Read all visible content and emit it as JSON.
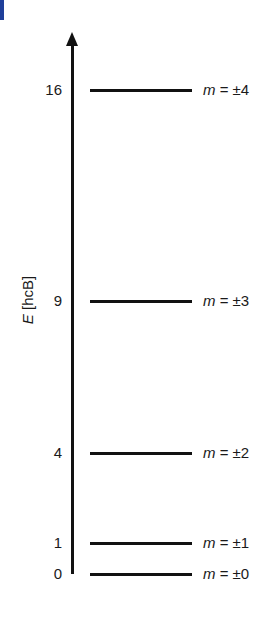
{
  "header": {
    "cut_off_text": ""
  },
  "chart_data": {
    "type": "energy-level-diagram",
    "title": "",
    "ylabel_var": "E",
    "ylabel_unit": "[hcB]",
    "levels": [
      {
        "energy": "16",
        "label_var": "m",
        "label_rest": " = ±4",
        "y": 80
      },
      {
        "energy": "9",
        "label_var": "m",
        "label_rest": " = ±3",
        "y": 291
      },
      {
        "energy": "4",
        "label_var": "m",
        "label_rest": " = ±2",
        "y": 443
      },
      {
        "energy": "1",
        "label_var": "m",
        "label_rest": " = ±1",
        "y": 533
      },
      {
        "energy": "0",
        "label_var": "m",
        "label_rest": " = ±0",
        "y": 564
      }
    ],
    "values": [
      16,
      9,
      4,
      1,
      0
    ],
    "categories": [
      "m = ±4",
      "m = ±3",
      "m = ±2",
      "m = ±1",
      "m = ±0"
    ]
  },
  "colors": {
    "accent_bar": "#1f3f9a",
    "ink": "#111111"
  }
}
